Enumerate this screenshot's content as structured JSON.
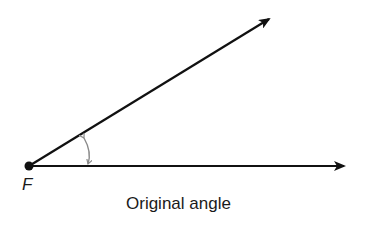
{
  "figure": {
    "vertex_label": "F",
    "caption": "Original angle",
    "colors": {
      "rays": "#111111",
      "angle_mark": "#8a8a8a",
      "text": "#1a1a1a"
    },
    "vertex": {
      "x": 29,
      "y": 166
    },
    "upper_ray_tip": {
      "x": 271,
      "y": 17
    },
    "lower_ray_tip": {
      "x": 346,
      "y": 166
    }
  }
}
